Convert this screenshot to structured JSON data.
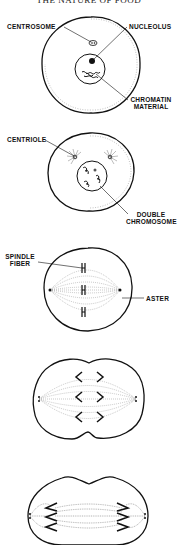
{
  "page": {
    "title": "THE NATURE OF FOOD"
  },
  "figures": [
    {
      "stage": 1,
      "labels": {
        "centrosome": "CENTROSOME",
        "nucleolus": "NUCLEOLUS",
        "chromatin_line1": "CHROMATIN",
        "chromatin_line2": "MATERIAL"
      }
    },
    {
      "stage": 2,
      "labels": {
        "centriole": "CENTRIOLE",
        "double_chromosome_line1": "DOUBLE",
        "double_chromosome_line2": "CHROMOSOME"
      }
    },
    {
      "stage": 3,
      "labels": {
        "spindle_fiber_line1": "SPINDLE",
        "spindle_fiber_line2": "FIBER",
        "aster": "ASTER"
      }
    },
    {
      "stage": 4,
      "labels": {}
    },
    {
      "stage": 5,
      "labels": {}
    }
  ],
  "colors": {
    "ink": "#111111",
    "paper": "#ffffff"
  }
}
